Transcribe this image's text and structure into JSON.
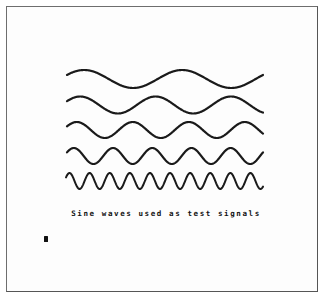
{
  "figure": {
    "caption": "Sine waves used as test signals",
    "stroke_color": "#1a1a1a",
    "background": "#ffffff",
    "border_color": "#6e6e6e",
    "cursor_icon": "block-cursor"
  },
  "waves": [
    {
      "name": "wave-1",
      "cycles": 2.0,
      "center_y": 79,
      "amplitude": 9,
      "x_start": 67,
      "x_end": 263,
      "phase_deg": 180,
      "stroke_width": 2.2
    },
    {
      "name": "wave-2",
      "cycles": 2.6,
      "center_y": 105,
      "amplitude": 8.5,
      "x_start": 67,
      "x_end": 263,
      "phase_deg": 180,
      "stroke_width": 2.2
    },
    {
      "name": "wave-3",
      "cycles": 3.5,
      "center_y": 130,
      "amplitude": 8,
      "x_start": 67,
      "x_end": 263,
      "phase_deg": 180,
      "stroke_width": 2.2
    },
    {
      "name": "wave-4",
      "cycles": 5.0,
      "center_y": 156,
      "amplitude": 8,
      "x_start": 67,
      "x_end": 263,
      "phase_deg": 180,
      "stroke_width": 2.2
    },
    {
      "name": "wave-5",
      "cycles": 9.8,
      "center_y": 181,
      "amplitude": 8,
      "x_start": 66,
      "x_end": 263,
      "phase_deg": 180,
      "stroke_width": 2.0
    }
  ]
}
